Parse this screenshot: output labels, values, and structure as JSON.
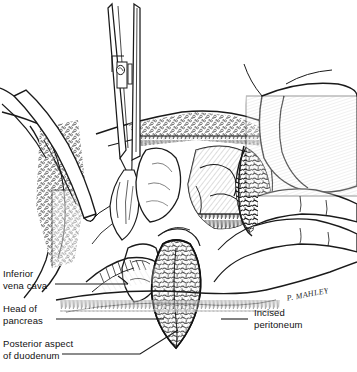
{
  "figure": {
    "medium": "pen-and-ink line drawing",
    "width": 357,
    "height": 372,
    "background_color": "#ffffff",
    "ink_color": "#1a1a1a"
  },
  "labels": {
    "inferior_vena_cava": "Inferior\nvena cava",
    "head_of_pancreas": "Head of\npancreas",
    "posterior_aspect_of_duodenum": "Posterior aspect\nof duodenum",
    "incised_peritoneum": "Incised\nperitoneum"
  },
  "signature": {
    "text": "P. MAHLEY"
  },
  "instruments": {
    "forceps": "surgical forceps with box-lock joint and ratchet",
    "retractor": "abdominal wall retractor blade"
  },
  "anatomy": [
    "abdominal wall with subcutaneous fat",
    "gloved retracting hand and fingers",
    "mobilised duodenum",
    "pancreatic head",
    "inferior vena cava",
    "incised posterior peritoneum"
  ]
}
